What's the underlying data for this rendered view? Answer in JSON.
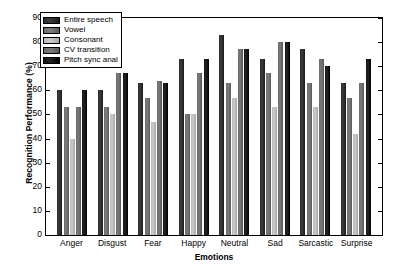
{
  "chart_data": {
    "type": "bar",
    "title": "",
    "xlabel": "Emotions",
    "ylabel": "Recognition Performance (%)",
    "ylim": [
      0,
      90
    ],
    "yticks": [
      0,
      10,
      20,
      30,
      40,
      50,
      60,
      70,
      80,
      90
    ],
    "grid": false,
    "legend_position": "upper-left-inside",
    "categories": [
      "Anger",
      "Disgust",
      "Fear",
      "Happy",
      "Neutral",
      "Sad",
      "Sarcastic",
      "Surprise"
    ],
    "series": [
      {
        "name": "Entire speech",
        "color": "#2b2b2b",
        "values": [
          60,
          60,
          63,
          73,
          83,
          73,
          77,
          63
        ]
      },
      {
        "name": "Vowel",
        "color": "#6d6d6d",
        "values": [
          53,
          53,
          57,
          50,
          63,
          67,
          63,
          57
        ]
      },
      {
        "name": "Consonant",
        "color": "#bcbcbc",
        "values": [
          40,
          50,
          47,
          50,
          57,
          53,
          53,
          42
        ]
      },
      {
        "name": "CV transition",
        "color": "#6a6a6a",
        "values": [
          53,
          67,
          64,
          67,
          77,
          80,
          73,
          63
        ]
      },
      {
        "name": "Pitch sync anal",
        "color": "#101010",
        "values": [
          60,
          67,
          63,
          73,
          77,
          80,
          70,
          73
        ]
      }
    ]
  }
}
